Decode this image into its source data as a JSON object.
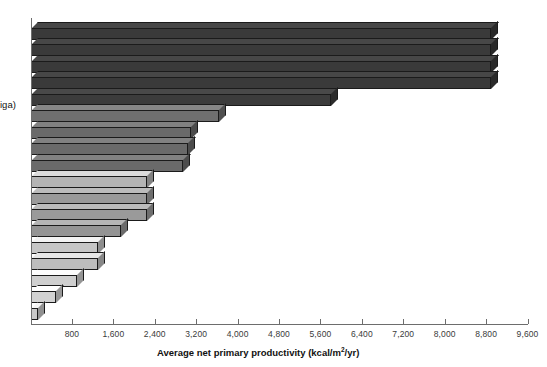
{
  "chart_data": {
    "type": "bar",
    "orientation": "horizontal",
    "title": "",
    "xlabel": "Average net primary productivity (kcal/m²/yr)",
    "ylabel_visible_fragment": "iga)",
    "ylabel": "",
    "xlim": [
      0,
      9600
    ],
    "xtick_step": 800,
    "grid": false,
    "legend": false,
    "xticks": [
      "0",
      "800",
      "1,600",
      "2,400",
      "3,200",
      "4,000",
      "4,800",
      "5,600",
      "6,400",
      "7,200",
      "8,000",
      "8,800",
      "9,600"
    ],
    "categories": [
      "bar-1",
      "bar-2",
      "bar-3",
      "bar-4",
      "bar-5",
      "bar-6",
      "bar-7",
      "bar-8",
      "bar-9",
      "bar-10",
      "bar-11",
      "bar-12",
      "bar-13",
      "bar-14",
      "bar-15",
      "bar-16",
      "bar-17",
      "bar-18"
    ],
    "values": [
      8900,
      8900,
      8900,
      8900,
      5800,
      3650,
      3100,
      3050,
      2950,
      2250,
      2250,
      2250,
      1750,
      1300,
      1300,
      900,
      500,
      150
    ],
    "bar_colors": [
      "#3a3a3a",
      "#3a3a3a",
      "#3a3a3a",
      "#3a3a3a",
      "#3c3c3c",
      "#6f6f6f",
      "#6a6a6a",
      "#6a6a6a",
      "#6a6a6a",
      "#b4b4b4",
      "#9a9a9a",
      "#9a9a9a",
      "#949494",
      "#c6c6c6",
      "#bdbdbd",
      "#cfcfcf",
      "#d2d2d2",
      "#c9c9c9"
    ]
  },
  "axis": {
    "xlabel": "Average net primary productivity (kcal/m",
    "xlabel_sup": "2",
    "xlabel_tail": "/yr)",
    "ylabel_fragment": "iga)"
  }
}
